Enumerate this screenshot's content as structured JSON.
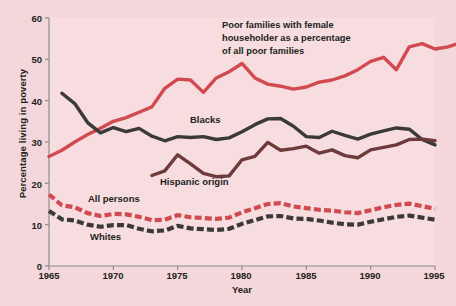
{
  "figure": {
    "background_color": "#f3d7da",
    "plot_background_color": "#f7dde0",
    "axis_color": "#8c8c8c"
  },
  "chart_data": {
    "type": "line",
    "title": "",
    "xlabel": "Year",
    "ylabel": "Percentage living in poverty",
    "xlim": [
      1965,
      1995
    ],
    "ylim": [
      0,
      60
    ],
    "xticks": [
      "1965",
      "1970",
      "1975",
      "1980",
      "1985",
      "1990",
      "1995"
    ],
    "yticks": [
      "0",
      "10",
      "20",
      "30",
      "40",
      "50",
      "60"
    ],
    "grid": false,
    "legend_position": "inline-annotations",
    "annotations": [
      {
        "name": "female-householder-annotation",
        "line1": "Poor families with female",
        "line2": "householder as a percentage",
        "line3": "of all poor families"
      }
    ],
    "series": [
      {
        "name": "Poor families with female householder as a percentage of all poor families",
        "label": "",
        "color": "#d04a50",
        "style": "solid",
        "x": [
          1965,
          1966,
          1967,
          1968,
          1969,
          1970,
          1971,
          1972,
          1973,
          1974,
          1975,
          1976,
          1977,
          1978,
          1979,
          1980,
          1981,
          1982,
          1983,
          1984,
          1985,
          1986,
          1987,
          1988,
          1989,
          1990,
          1991,
          1992,
          1993,
          1994,
          1995
        ],
        "values": [
          26.5,
          28.0,
          30.0,
          31.8,
          33.3,
          35.0,
          35.9,
          37.2,
          38.5,
          43.0,
          45.2,
          45.0,
          42.0,
          45.5,
          47.0,
          49.0,
          45.5,
          44.0,
          43.5,
          42.8,
          43.3,
          44.5,
          45.0,
          46.0,
          47.5,
          49.5,
          50.5,
          47.5,
          53.0,
          53.8,
          52.5
        ],
        "values_tail": [
          53.0,
          54.0
        ]
      },
      {
        "name": "Blacks",
        "label": "Blacks",
        "color": "#3c3a38",
        "style": "solid",
        "x": [
          1966,
          1967,
          1968,
          1969,
          1970,
          1971,
          1972,
          1973,
          1974,
          1975,
          1976,
          1977,
          1978,
          1979,
          1980,
          1981,
          1982,
          1983,
          1984,
          1985,
          1986,
          1987,
          1988,
          1989,
          1990,
          1991,
          1992,
          1993,
          1994,
          1995
        ],
        "values": [
          41.8,
          39.3,
          34.7,
          32.2,
          33.5,
          32.5,
          33.3,
          31.4,
          30.3,
          31.3,
          31.1,
          31.3,
          30.6,
          31.0,
          32.5,
          34.2,
          35.6,
          35.7,
          33.8,
          31.3,
          31.1,
          32.6,
          31.6,
          30.7,
          31.9,
          32.7,
          33.4,
          33.1,
          30.6,
          29.3
        ]
      },
      {
        "name": "Hispanic origin",
        "label": "Hispanic origin",
        "color": "#6d3b39",
        "style": "solid",
        "x": [
          1973,
          1974,
          1975,
          1976,
          1977,
          1978,
          1979,
          1980,
          1981,
          1982,
          1983,
          1984,
          1985,
          1986,
          1987,
          1988,
          1989,
          1990,
          1991,
          1992,
          1993,
          1994,
          1995
        ],
        "values": [
          21.9,
          23.0,
          26.9,
          24.7,
          22.4,
          21.6,
          21.8,
          25.7,
          26.5,
          29.9,
          28.0,
          28.4,
          29.0,
          27.3,
          28.1,
          26.7,
          26.2,
          28.1,
          28.7,
          29.3,
          30.6,
          30.7,
          30.3
        ]
      },
      {
        "name": "All persons",
        "label": "All persons",
        "color": "#d04a50",
        "style": "dashed",
        "x": [
          1965,
          1966,
          1967,
          1968,
          1969,
          1970,
          1971,
          1972,
          1973,
          1974,
          1975,
          1976,
          1977,
          1978,
          1979,
          1980,
          1981,
          1982,
          1983,
          1984,
          1985,
          1986,
          1987,
          1988,
          1989,
          1990,
          1991,
          1992,
          1993,
          1994,
          1995
        ],
        "values": [
          17.3,
          14.7,
          14.2,
          12.8,
          12.1,
          12.6,
          12.5,
          11.9,
          11.1,
          11.2,
          12.3,
          11.8,
          11.6,
          11.4,
          11.7,
          13.0,
          14.0,
          15.0,
          15.2,
          14.4,
          14.0,
          13.6,
          13.4,
          13.0,
          12.8,
          13.5,
          14.2,
          14.8,
          15.1,
          14.5,
          13.8
        ]
      },
      {
        "name": "Whites",
        "label": "Whites",
        "color": "#3c3a38",
        "style": "dashed",
        "x": [
          1965,
          1966,
          1967,
          1968,
          1969,
          1970,
          1971,
          1972,
          1973,
          1974,
          1975,
          1976,
          1977,
          1978,
          1979,
          1980,
          1981,
          1982,
          1983,
          1984,
          1985,
          1986,
          1987,
          1988,
          1989,
          1990,
          1991,
          1992,
          1993,
          1994,
          1995
        ],
        "values": [
          13.3,
          11.3,
          11.0,
          10.0,
          9.5,
          9.9,
          9.9,
          9.0,
          8.4,
          8.6,
          9.7,
          9.1,
          8.9,
          8.7,
          9.0,
          10.2,
          11.1,
          12.0,
          12.1,
          11.5,
          11.4,
          11.0,
          10.5,
          10.1,
          10.0,
          10.7,
          11.3,
          11.9,
          12.2,
          11.7,
          11.2
        ]
      }
    ]
  }
}
